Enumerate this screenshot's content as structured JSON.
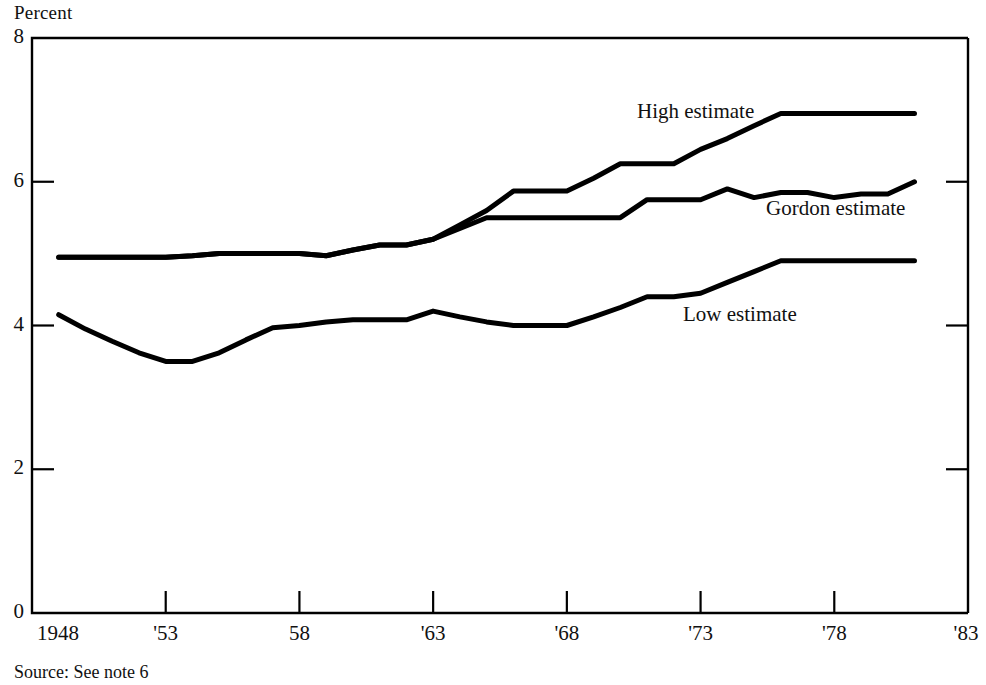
{
  "figure": {
    "axis_title": "Percent",
    "source_note": "Source: See note 6",
    "line_color": "#000000",
    "background_color": "#ffffff"
  },
  "y_axis": {
    "ticks": [
      "0",
      "2",
      "4",
      "6",
      "8"
    ]
  },
  "x_axis": {
    "ticks": [
      "1948",
      "'53",
      "58",
      "'63",
      "'68",
      "'73",
      "'78",
      "'83"
    ]
  },
  "series_labels": {
    "high": "High estimate",
    "gordon": "Gordon estimate",
    "low": "Low estimate"
  },
  "chart_data": {
    "type": "line",
    "title": "",
    "xlabel": "",
    "ylabel": "Percent",
    "xlim": [
      1948,
      1983
    ],
    "ylim": [
      0,
      8
    ],
    "yticks": [
      0,
      2,
      4,
      6,
      8
    ],
    "xticks": [
      1948,
      1953,
      1958,
      1963,
      1968,
      1973,
      1978,
      1983
    ],
    "grid": false,
    "legend": "inline-annotations",
    "x": [
      1949,
      1950,
      1951,
      1952,
      1953,
      1954,
      1955,
      1956,
      1957,
      1958,
      1959,
      1960,
      1961,
      1962,
      1963,
      1964,
      1965,
      1966,
      1967,
      1968,
      1969,
      1970,
      1971,
      1972,
      1973,
      1974,
      1975,
      1976,
      1977,
      1978,
      1979,
      1980,
      1981
    ],
    "series": [
      {
        "name": "High estimate",
        "values": [
          4.95,
          4.95,
          4.95,
          4.95,
          4.95,
          4.97,
          5.0,
          5.0,
          5.0,
          5.0,
          4.97,
          5.05,
          5.12,
          5.12,
          5.2,
          5.4,
          5.6,
          5.87,
          5.87,
          5.87,
          6.05,
          6.25,
          6.25,
          6.25,
          6.45,
          6.6,
          6.78,
          6.95,
          6.95,
          6.95,
          6.95,
          6.95,
          6.95
        ]
      },
      {
        "name": "Gordon estimate",
        "values": [
          4.95,
          4.95,
          4.95,
          4.95,
          4.95,
          4.97,
          5.0,
          5.0,
          5.0,
          5.0,
          4.97,
          5.05,
          5.12,
          5.12,
          5.2,
          5.35,
          5.5,
          5.5,
          5.5,
          5.5,
          5.5,
          5.5,
          5.75,
          5.75,
          5.75,
          5.9,
          5.78,
          5.85,
          5.85,
          5.78,
          5.83,
          5.83,
          6.0
        ]
      },
      {
        "name": "Low estimate",
        "values": [
          4.15,
          3.95,
          3.78,
          3.62,
          3.5,
          3.5,
          3.62,
          3.8,
          3.97,
          4.0,
          4.05,
          4.08,
          4.08,
          4.08,
          4.2,
          4.12,
          4.05,
          4.0,
          4.0,
          4.0,
          4.12,
          4.25,
          4.4,
          4.4,
          4.45,
          4.6,
          4.75,
          4.9,
          4.9,
          4.9,
          4.9,
          4.9,
          4.9
        ]
      }
    ]
  }
}
